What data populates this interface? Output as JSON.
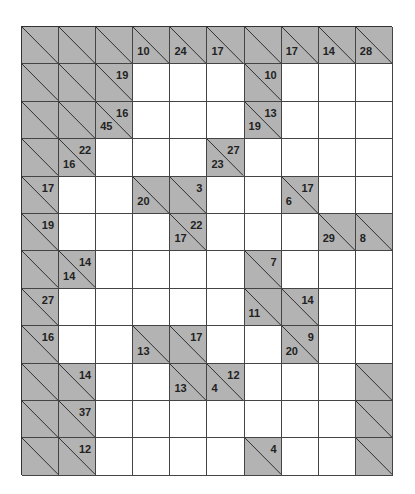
{
  "puzzle": {
    "type": "kakuro",
    "rows": 12,
    "cols": 10,
    "colors": {
      "block": "#b3b3b3",
      "white": "#ffffff",
      "line": "#333333"
    },
    "grid": [
      [
        "B",
        "B",
        "B",
        {
          "d": 10
        },
        {
          "d": 24
        },
        {
          "d": 17
        },
        "B",
        {
          "d": 17
        },
        {
          "d": 14
        },
        {
          "d": 28
        }
      ],
      [
        "B",
        "B",
        {
          "r": 19
        },
        "W",
        "W",
        "W",
        {
          "r": 10
        },
        "W",
        "W",
        "W"
      ],
      [
        "B",
        "B",
        {
          "d": 45,
          "r": 16
        },
        "W",
        "W",
        "W",
        {
          "d": 19,
          "r": 13
        },
        "W",
        "W",
        "W"
      ],
      [
        "B",
        {
          "d": 16,
          "r": 22
        },
        "W",
        "W",
        "W",
        {
          "d": 23,
          "r": 27
        },
        "W",
        "W",
        "W",
        "W"
      ],
      [
        {
          "r": 17
        },
        "W",
        "W",
        {
          "d": 20
        },
        {
          "r": 3
        },
        "W",
        "W",
        {
          "d": 6,
          "r": 17
        },
        "W",
        "W"
      ],
      [
        {
          "r": 19
        },
        "W",
        "W",
        "W",
        {
          "d": 17,
          "r": 22
        },
        "W",
        "W",
        "W",
        {
          "d": 29
        },
        {
          "d": 8
        }
      ],
      [
        "B",
        {
          "d": 14,
          "r": 14
        },
        "W",
        "W",
        "W",
        "W",
        {
          "r": 7
        },
        "W",
        "W",
        "W"
      ],
      [
        {
          "r": 27
        },
        "W",
        "W",
        "W",
        "W",
        "W",
        {
          "d": 11
        },
        {
          "r": 14
        },
        "W",
        "W"
      ],
      [
        {
          "r": 16
        },
        "W",
        "W",
        {
          "d": 13
        },
        {
          "r": 17
        },
        "W",
        "W",
        {
          "d": 20,
          "r": 9
        },
        "W",
        "W"
      ],
      [
        "B",
        {
          "r": 14
        },
        "W",
        "W",
        {
          "d": 13
        },
        {
          "d": 4,
          "r": 12
        },
        "W",
        "W",
        "W",
        "B"
      ],
      [
        "B",
        {
          "r": 37
        },
        "W",
        "W",
        "W",
        "W",
        "W",
        "W",
        "W",
        "B"
      ],
      [
        "B",
        {
          "r": 12
        },
        "W",
        "W",
        "W",
        "W",
        {
          "r": 4
        },
        "W",
        "W",
        "B"
      ]
    ]
  }
}
